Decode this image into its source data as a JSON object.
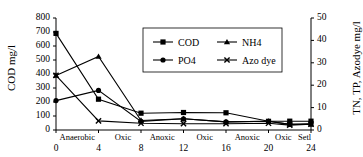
{
  "chart_data": {
    "type": "line",
    "title": "",
    "xlabel": "",
    "ylabel": "COD mg/l",
    "y2label": "TN, TP, Azodye mg/l",
    "x": [
      0,
      4,
      8,
      12,
      16,
      20,
      22,
      24
    ],
    "xlim": [
      0,
      24
    ],
    "ylim": [
      0,
      800
    ],
    "y2lim": [
      0,
      50
    ],
    "xticks": [
      "0",
      "4",
      "8",
      "12",
      "16",
      "20",
      "24"
    ],
    "xtick_values": [
      0,
      4,
      8,
      12,
      16,
      20,
      24
    ],
    "yticks_left": [
      "0",
      "100",
      "200",
      "300",
      "400",
      "500",
      "600",
      "700",
      "800"
    ],
    "ytick_left_values": [
      0,
      100,
      200,
      300,
      400,
      500,
      600,
      700,
      800
    ],
    "yticks_right": [
      "0",
      "10",
      "20",
      "30",
      "40",
      "50"
    ],
    "ytick_right_values": [
      0,
      10,
      20,
      30,
      40,
      50
    ],
    "grid": false,
    "legend_position": "upper-center",
    "phase_labels": [
      {
        "label": "Anaerobic",
        "x": 2.0
      },
      {
        "label": "Oxic",
        "x": 6.3
      },
      {
        "label": "Anoxic",
        "x": 10.0
      },
      {
        "label": "Oxic",
        "x": 14.0
      },
      {
        "label": "Anoxic",
        "x": 18.0
      },
      {
        "label": "Oxic",
        "x": 21.4
      },
      {
        "label": "Setl",
        "x": 23.4
      }
    ],
    "series": [
      {
        "name": "COD",
        "axis": "left",
        "marker": "square",
        "unit": "mg/l",
        "values": [
          690,
          220,
          120,
          125,
          123,
          62,
          63,
          63
        ]
      },
      {
        "name": "NH4",
        "axis": "left",
        "marker": "triangle",
        "unit": "mg/l",
        "values": [
          390,
          525,
          68,
          80,
          58,
          62,
          40,
          42
        ]
      },
      {
        "name": "PO4",
        "axis": "left",
        "marker": "circle",
        "unit": "mg/l",
        "values": [
          210,
          283,
          62,
          80,
          58,
          62,
          40,
          42
        ]
      },
      {
        "name": "Azo dye",
        "axis": "left",
        "marker": "cross",
        "unit": "mg/l",
        "values": [
          390,
          65,
          48,
          45,
          45,
          48,
          35,
          42
        ]
      }
    ],
    "legend": [
      {
        "label": "COD",
        "marker": "square"
      },
      {
        "label": "NH4",
        "marker": "triangle"
      },
      {
        "label": "PO4",
        "marker": "circle"
      },
      {
        "label": "Azo dye",
        "marker": "cross"
      }
    ],
    "colors": {
      "line": "#000000",
      "marker": "#000000",
      "axis": "#000000",
      "background": "#ffffff"
    }
  }
}
